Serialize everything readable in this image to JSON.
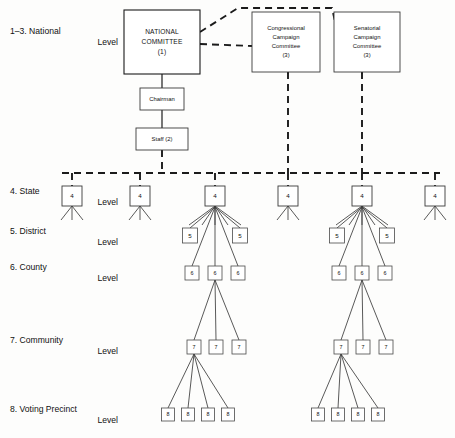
{
  "levels": [
    {
      "id": "national",
      "label_line1": "1–3. National",
      "label_line2": "Level",
      "x": 10,
      "y": 32
    },
    {
      "id": "state",
      "label_line1": "4. State",
      "label_line2": "Level",
      "x": 10,
      "y": 192
    },
    {
      "id": "district",
      "label_line1": "5. District",
      "label_line2": "Level",
      "x": 10,
      "y": 232
    },
    {
      "id": "county",
      "label_line1": "6. County",
      "label_line2": "Level",
      "x": 10,
      "y": 268
    },
    {
      "id": "community",
      "label_line1": "7. Community",
      "label_line2": "Level",
      "x": 10,
      "y": 341
    },
    {
      "id": "precinct",
      "label_line1": "8. Voting Precinct",
      "label_line2": "Level",
      "x": 10,
      "y": 410
    }
  ],
  "national_boxes": [
    {
      "id": "national-committee",
      "lines": [
        "NATIONAL",
        "COMMITTEE",
        "(1)"
      ],
      "x": 124,
      "y": 10,
      "w": 76,
      "h": 64,
      "style": "title"
    },
    {
      "id": "congressional-campaign-committee",
      "lines": [
        "Congressional",
        "Campaign",
        "Committee",
        "(3)"
      ],
      "x": 252,
      "y": 12,
      "w": 68,
      "h": 60,
      "style": "small"
    },
    {
      "id": "senatorial-campaign-committee",
      "lines": [
        "Senatorial",
        "Campaign",
        "Committee",
        "(3)"
      ],
      "x": 334,
      "y": 12,
      "w": 66,
      "h": 60,
      "style": "small"
    },
    {
      "id": "chairman",
      "lines": [
        "Chairman"
      ],
      "x": 140,
      "y": 88,
      "w": 44,
      "h": 22,
      "style": "small"
    },
    {
      "id": "staff",
      "lines": [
        "Staff (2)"
      ],
      "x": 136,
      "y": 128,
      "w": 52,
      "h": 22,
      "style": "small"
    }
  ],
  "state_nodes": [
    {
      "id": "state-1",
      "value": "4",
      "cx": 72,
      "legs": 3,
      "big": false
    },
    {
      "id": "state-2",
      "value": "4",
      "cx": 140,
      "legs": 3,
      "big": false
    },
    {
      "id": "state-3",
      "value": "4",
      "cx": 215,
      "legs": 5,
      "big": true
    },
    {
      "id": "state-4",
      "value": "4",
      "cx": 288,
      "legs": 3,
      "big": false
    },
    {
      "id": "state-5",
      "value": "4",
      "cx": 362,
      "legs": 5,
      "big": true
    },
    {
      "id": "state-6",
      "value": "4",
      "cx": 435,
      "legs": 3,
      "big": false
    }
  ],
  "clusters": [
    {
      "id": "cluster-left",
      "root_cx": 215,
      "district": [
        {
          "id": "district-left-1",
          "value": "5",
          "cx": 190
        },
        {
          "id": "district-left-2",
          "value": "5",
          "cx": 240
        }
      ],
      "county": [
        {
          "id": "county-left-1",
          "value": "6",
          "cx": 192
        },
        {
          "id": "county-left-2",
          "value": "6",
          "cx": 215
        },
        {
          "id": "county-left-3",
          "value": "6",
          "cx": 238
        }
      ],
      "county_expanded_index": 1,
      "community": [
        {
          "id": "community-left-1",
          "value": "7",
          "cx": 194
        },
        {
          "id": "community-left-2",
          "value": "7",
          "cx": 216
        },
        {
          "id": "community-left-3",
          "value": "7",
          "cx": 239
        }
      ],
      "community_expanded_index": 0,
      "precinct": [
        {
          "id": "precinct-left-1",
          "value": "8",
          "cx": 168
        },
        {
          "id": "precinct-left-2",
          "value": "8",
          "cx": 188
        },
        {
          "id": "precinct-left-3",
          "value": "8",
          "cx": 208
        },
        {
          "id": "precinct-left-4",
          "value": "8",
          "cx": 228
        }
      ]
    },
    {
      "id": "cluster-right",
      "root_cx": 362,
      "district": [
        {
          "id": "district-right-1",
          "value": "5",
          "cx": 337
        },
        {
          "id": "district-right-2",
          "value": "5",
          "cx": 387
        }
      ],
      "county": [
        {
          "id": "county-right-1",
          "value": "6",
          "cx": 339
        },
        {
          "id": "county-right-2",
          "value": "6",
          "cx": 362
        },
        {
          "id": "county-right-3",
          "value": "6",
          "cx": 385
        }
      ],
      "county_expanded_index": 1,
      "community": [
        {
          "id": "community-right-1",
          "value": "7",
          "cx": 341
        },
        {
          "id": "community-right-2",
          "value": "7",
          "cx": 363
        },
        {
          "id": "community-right-3",
          "value": "7",
          "cx": 386
        }
      ],
      "community_expanded_index": 0,
      "precinct": [
        {
          "id": "precinct-right-1",
          "value": "8",
          "cx": 318
        },
        {
          "id": "precinct-right-2",
          "value": "8",
          "cx": 338
        },
        {
          "id": "precinct-right-3",
          "value": "8",
          "cx": 358
        },
        {
          "id": "precinct-right-4",
          "value": "8",
          "cx": 378
        }
      ]
    }
  ],
  "geometry": {
    "state_y": 186,
    "state_box": 20,
    "district_y": 228,
    "district_box": 15,
    "county_y": 266,
    "county_box": 14,
    "community_y": 340,
    "community_box": 14,
    "precinct_y": 408,
    "precinct_box": 13,
    "bus_y": 173,
    "bus_x1": 62,
    "bus_x2": 440,
    "staff_stem_x": 162
  },
  "colors": {
    "ink": "#1b1b1b",
    "thin_ink": "#3b3b3b",
    "paper": "#fdfdfc"
  }
}
